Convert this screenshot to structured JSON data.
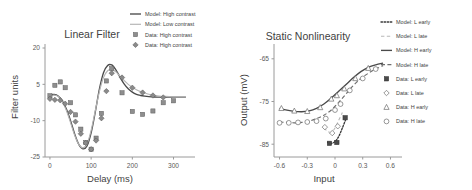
{
  "figure": {
    "panels": [
      {
        "id": "linear-filter",
        "title": "Linear Filter",
        "xlabel": "Delay (ms)",
        "ylabel": "Filter units"
      },
      {
        "id": "static-nonlinearity",
        "title": "Static Nonlinearity",
        "xlabel": "Input",
        "ylabel": "Output (mV)"
      }
    ]
  },
  "chart_data": [
    {
      "type": "line",
      "id": "linear-filter",
      "title": "Linear Filter",
      "xlabel": "Delay (ms)",
      "ylabel": "Filter units",
      "xlim": [
        -12,
        340
      ],
      "ylim": [
        -25,
        20
      ],
      "xticks": [
        0,
        100,
        200,
        300
      ],
      "xticklabels": [
        "0",
        "100",
        "200",
        "300"
      ],
      "yticks": [
        20,
        5,
        -10,
        -25
      ],
      "yticklabels": [
        "20",
        "5",
        "-10",
        "-25"
      ],
      "grid": false,
      "legend_position": "top-right",
      "series": [
        {
          "name": "Model: High contrast",
          "style": "solid-dark",
          "marker": "none",
          "x": [
            0,
            10,
            20,
            30,
            40,
            50,
            60,
            70,
            80,
            90,
            100,
            110,
            120,
            130,
            140,
            150,
            160,
            170,
            180,
            190,
            200,
            210,
            220,
            230,
            240,
            250,
            260,
            270,
            280,
            290,
            300,
            310,
            320,
            330
          ],
          "y": [
            0.5,
            0.8,
            0.2,
            -1.8,
            -5.2,
            -10.0,
            -15.5,
            -19.8,
            -21.6,
            -20.4,
            -15.0,
            -6.5,
            3.0,
            9.8,
            12.8,
            13.0,
            11.0,
            8.0,
            5.2,
            3.2,
            1.8,
            0.9,
            0.4,
            0.1,
            -0.1,
            -0.2,
            -0.3,
            -0.3,
            -0.3,
            -0.3,
            -0.3,
            -0.3,
            -0.3,
            -0.3
          ]
        },
        {
          "name": "Model: Low contrast",
          "style": "solid-light",
          "marker": "none",
          "x": [
            0,
            10,
            20,
            30,
            40,
            50,
            60,
            70,
            80,
            90,
            100,
            110,
            120,
            130,
            140,
            150,
            160,
            170,
            180,
            190,
            200,
            210,
            220,
            230,
            240,
            250,
            260,
            270,
            280,
            290,
            300,
            310,
            320,
            330
          ],
          "y": [
            0.2,
            0.6,
            0.0,
            -2.2,
            -5.8,
            -10.8,
            -16.0,
            -19.8,
            -21.2,
            -19.6,
            -14.0,
            -6.0,
            2.0,
            7.8,
            10.6,
            11.2,
            10.2,
            8.4,
            6.6,
            5.0,
            3.8,
            2.8,
            2.0,
            1.4,
            0.9,
            0.6,
            0.3,
            0.1,
            0.0,
            -0.1,
            -0.2,
            -0.2,
            -0.2,
            -0.2
          ]
        },
        {
          "name": "Data: High contrast",
          "style": "markers",
          "marker": "square",
          "x": [
            0,
            12,
            25,
            37,
            50,
            62,
            75,
            87,
            100,
            112,
            125,
            137,
            150,
            175,
            200,
            225,
            250,
            275,
            300
          ],
          "y": [
            0.3,
            4.6,
            6.0,
            3.6,
            -2.6,
            -7.6,
            -13.5,
            -19.0,
            -21.8,
            -17.2,
            -7.0,
            6.4,
            11.5,
            1.5,
            -6.2,
            -7.4,
            -6.0,
            -2.6,
            -1.8
          ]
        },
        {
          "name": "Data: High contrast",
          "style": "markers",
          "marker": "diamond",
          "x": [
            0,
            12,
            25,
            37,
            50,
            62,
            75,
            87,
            100,
            112,
            125,
            137,
            150,
            175,
            200,
            225,
            250,
            275
          ],
          "y": [
            -1.0,
            -1.4,
            -1.6,
            -3.0,
            -6.4,
            -10.4,
            -15.4,
            -19.2,
            -21.8,
            -18.2,
            -9.0,
            2.2,
            9.6,
            7.8,
            3.6,
            1.6,
            0.4,
            -0.4
          ]
        }
      ]
    },
    {
      "type": "line",
      "id": "static-nonlinearity",
      "title": "Static Nonlinearity",
      "xlabel": "Input",
      "ylabel": "Output (mV)",
      "xlim": [
        -0.66,
        0.66
      ],
      "ylim": [
        -88,
        -62
      ],
      "xticks": [
        -0.6,
        -0.3,
        0,
        0.3,
        0.6
      ],
      "xticklabels": [
        "-0.6",
        "-0.3",
        "0",
        "0.3",
        "0.6"
      ],
      "yticks": [
        -65,
        -75,
        -85
      ],
      "yticklabels": [
        "-65",
        "-75",
        "-85"
      ],
      "grid": false,
      "legend_position": "right",
      "series": [
        {
          "name": "Model: L early",
          "style": "dotted-dark",
          "marker": "none",
          "x": [
            -0.08,
            -0.04,
            0.0,
            0.04,
            0.08,
            0.12
          ],
          "y": [
            -84.6,
            -84.8,
            -84.4,
            -83.2,
            -81.2,
            -79.0
          ]
        },
        {
          "name": "Model: L late",
          "style": "dashed-light",
          "marker": "none",
          "x": [
            -0.12,
            -0.08,
            -0.04,
            0.0,
            0.04,
            0.08
          ],
          "y": [
            -81.2,
            -82.0,
            -82.2,
            -81.2,
            -79.4,
            -77.6
          ]
        },
        {
          "name": "Model: H early",
          "style": "solid-dark",
          "marker": "none",
          "x": [
            -0.6,
            -0.52,
            -0.44,
            -0.36,
            -0.28,
            -0.2,
            -0.12,
            -0.04,
            0.04,
            0.12,
            0.2,
            0.28,
            0.36,
            0.44,
            0.52
          ],
          "y": [
            -76.6,
            -77.0,
            -77.3,
            -77.4,
            -77.2,
            -76.6,
            -75.6,
            -74.2,
            -72.6,
            -71.0,
            -69.4,
            -68.0,
            -67.0,
            -66.4,
            -66.0
          ]
        },
        {
          "name": "Model: H late",
          "style": "dashed-dark",
          "marker": "none",
          "x": [
            -0.6,
            -0.52,
            -0.44,
            -0.36,
            -0.28,
            -0.2,
            -0.12,
            -0.04,
            0.04,
            0.12,
            0.2,
            0.28,
            0.36,
            0.44,
            0.52
          ],
          "y": [
            -79.8,
            -79.9,
            -80.0,
            -79.9,
            -79.6,
            -79.0,
            -78.2,
            -77.0,
            -75.2,
            -73.2,
            -71.2,
            -69.6,
            -68.4,
            -67.4,
            -66.6
          ]
        },
        {
          "name": "Data: L early",
          "style": "markers",
          "marker": "square-filled",
          "x": [
            -0.06,
            0.02,
            0.11
          ],
          "y": [
            -84.8,
            -84.6,
            -78.8
          ]
        },
        {
          "name": "Data: L late",
          "style": "markers",
          "marker": "diamond-open",
          "x": [
            -0.11,
            -0.03,
            0.03
          ],
          "y": [
            -81.0,
            -82.4,
            -80.8
          ]
        },
        {
          "name": "Data: H early",
          "style": "markers",
          "marker": "triangle-open",
          "x": [
            -0.58,
            -0.44,
            -0.3,
            -0.16,
            -0.04,
            0.02,
            0.1,
            0.22,
            0.36
          ],
          "y": [
            -76.6,
            -77.2,
            -77.3,
            -76.4,
            -74.4,
            -73.6,
            -72.0,
            -69.6,
            -67.2
          ]
        },
        {
          "name": "Data: H late",
          "style": "markers",
          "marker": "circle-open",
          "x": [
            -0.6,
            -0.5,
            -0.4,
            -0.3,
            -0.2,
            -0.1,
            0.0,
            0.06,
            0.16,
            0.3,
            0.44
          ],
          "y": [
            -80.0,
            -80.0,
            -79.9,
            -79.8,
            -79.6,
            -79.0,
            -77.0,
            -75.6,
            -72.4,
            -69.6,
            -67.4
          ]
        }
      ]
    }
  ],
  "left_legend": {
    "items": [
      {
        "label": "Model: High contrast",
        "glyph": "line-dark"
      },
      {
        "label": "Model: Low contrast",
        "glyph": "line-light"
      },
      {
        "label": "Data: High contrast",
        "glyph": "square"
      },
      {
        "label": "Data: High contrast",
        "glyph": "diamond"
      }
    ]
  },
  "right_legend": {
    "items": [
      {
        "label": "Model: L early",
        "glyph": "line-dotted"
      },
      {
        "label": "Model: L late",
        "glyph": "line-dashed-light"
      },
      {
        "label": "Model: H early",
        "glyph": "line-solid"
      },
      {
        "label": "Model: H late",
        "glyph": "line-dashed-dark"
      },
      {
        "label": "Data: L early",
        "glyph": "square-filled"
      },
      {
        "label": "Data: L late",
        "glyph": "diamond-open"
      },
      {
        "label": "Data: H early",
        "glyph": "triangle-open"
      },
      {
        "label": "Data: H late",
        "glyph": "circle-open"
      }
    ]
  },
  "colors": {
    "dark": "#4a4a4a",
    "light": "#b4b4b4",
    "axis": "#9a9a9a",
    "text": "#3f3f3f"
  }
}
